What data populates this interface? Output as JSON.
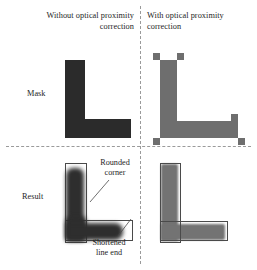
{
  "figure": {
    "columns": [
      {
        "id": "no-opc",
        "header": "Without optical proximity correction"
      },
      {
        "id": "with-opc",
        "header": "With optical proximity correction"
      }
    ],
    "rows": [
      {
        "id": "mask",
        "label": "Mask"
      },
      {
        "id": "result",
        "label": "Result"
      }
    ],
    "annotations": [
      {
        "id": "rounded-corner",
        "line1": "Rounded",
        "line2": "corner"
      },
      {
        "id": "shortened-line-end",
        "line1": "Shortened",
        "line2": "line end"
      }
    ],
    "colors": {
      "mask_dark": "#2b2b2b",
      "mask_grey": "#6e6e6e",
      "result_dark": "#2e2e2e",
      "result_grey": "#737373",
      "outline": "#4a4a4a",
      "divider": "#9a9a9a",
      "background": "#ffffff",
      "text": "#1e1e1e"
    },
    "shapes": {
      "mask_plain": {
        "name": "solid-L-mask",
        "fill": "#2b2b2b",
        "serifs": 0,
        "notch": false
      },
      "mask_opc": {
        "name": "L-mask-with-opc-features",
        "fill": "#6e6e6e",
        "serifs": 5,
        "serif_positions": [
          "top-left",
          "top-right",
          "bottom-left",
          "bottom-right",
          "right-end"
        ],
        "notch": true,
        "notch_position": "inner-corner"
      },
      "result_plain": {
        "name": "blurred-L-result",
        "fill": "#2e2e2e",
        "corner": "rounded",
        "line_end": "shortened"
      },
      "result_opc": {
        "name": "corrected-L-result",
        "fill": "#737373",
        "corner": "sharp",
        "line_end": "full-length"
      }
    }
  }
}
